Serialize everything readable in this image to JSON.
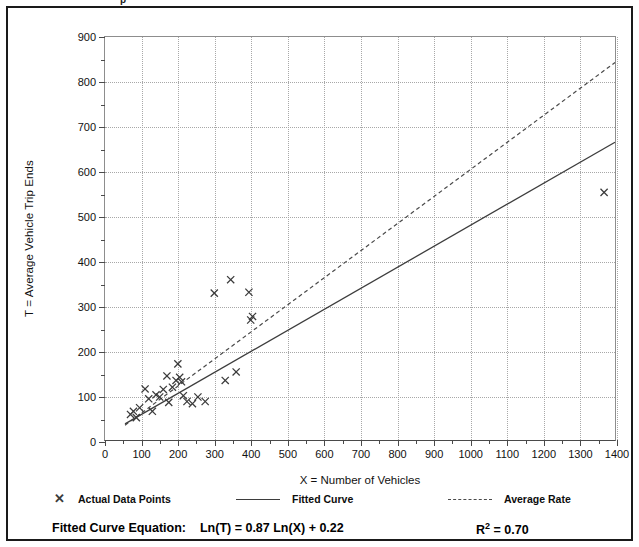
{
  "page_bleed_text": "p",
  "chart_data": {
    "type": "scatter",
    "title": "",
    "xlabel": "X = Number of Vehicles",
    "ylabel": "T = Average Vehicle Trip Ends",
    "xlim": [
      0,
      1400
    ],
    "ylim": [
      0,
      900
    ],
    "x_ticks": [
      0,
      100,
      200,
      300,
      400,
      500,
      600,
      700,
      800,
      900,
      1000,
      1100,
      1200,
      1300,
      1400
    ],
    "y_ticks": [
      0,
      100,
      200,
      300,
      400,
      500,
      600,
      700,
      800,
      900
    ],
    "x_minor_step": 50,
    "y_minor_step": 50,
    "grid": true,
    "legend_position": "below-axes",
    "points": [
      {
        "x": 70,
        "y": 57
      },
      {
        "x": 78,
        "y": 64
      },
      {
        "x": 86,
        "y": 50
      },
      {
        "x": 95,
        "y": 72
      },
      {
        "x": 110,
        "y": 114
      },
      {
        "x": 120,
        "y": 92
      },
      {
        "x": 130,
        "y": 64
      },
      {
        "x": 140,
        "y": 101
      },
      {
        "x": 150,
        "y": 96
      },
      {
        "x": 160,
        "y": 113
      },
      {
        "x": 170,
        "y": 143
      },
      {
        "x": 175,
        "y": 84
      },
      {
        "x": 185,
        "y": 118
      },
      {
        "x": 195,
        "y": 133
      },
      {
        "x": 200,
        "y": 170
      },
      {
        "x": 205,
        "y": 140
      },
      {
        "x": 210,
        "y": 130
      },
      {
        "x": 215,
        "y": 99
      },
      {
        "x": 225,
        "y": 86
      },
      {
        "x": 240,
        "y": 81
      },
      {
        "x": 255,
        "y": 96
      },
      {
        "x": 275,
        "y": 86
      },
      {
        "x": 300,
        "y": 328
      },
      {
        "x": 330,
        "y": 133
      },
      {
        "x": 345,
        "y": 358
      },
      {
        "x": 360,
        "y": 152
      },
      {
        "x": 395,
        "y": 330
      },
      {
        "x": 400,
        "y": 268
      },
      {
        "x": 405,
        "y": 276
      },
      {
        "x": 1370,
        "y": 553
      }
    ],
    "series": [
      {
        "name": "Fitted Curve",
        "type": "line",
        "style": "solid",
        "equation": "Ln(T) = 0.87 Ln(X) + 0.22",
        "coef_a": 0.87,
        "coef_b": 0.22,
        "x_start": 55,
        "x_end": 1400,
        "y_start": 36,
        "y_end": 665
      },
      {
        "name": "Average Rate",
        "type": "line",
        "style": "dashed",
        "x_start": 55,
        "x_end": 1400,
        "y_start": 33,
        "y_end": 843
      }
    ]
  },
  "legend": {
    "items": [
      {
        "label": "Actual Data Points",
        "swatch": "marker",
        "glyph": "✕"
      },
      {
        "label": "Fitted Curve",
        "swatch": "solid"
      },
      {
        "label": "Average Rate",
        "swatch": "dashed"
      }
    ]
  },
  "footer": {
    "equation_label": "Fitted Curve Equation:",
    "equation_value": "Ln(T) = 0.87 Ln(X) + 0.22",
    "r2_label": "R",
    "r2_exponent": "2",
    "r2_value": " = 0.70"
  },
  "colors": {
    "frame": "#1a1a1a",
    "grid": "#a8a8a8",
    "axis": "#4a4a4a",
    "marker": "#3a3a3a",
    "fitted_curve": "#3d3d3d",
    "average_rate": "#4a4a4a",
    "text": "#000000"
  }
}
